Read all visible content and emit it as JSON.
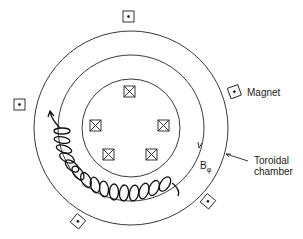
{
  "diagram": {
    "labels": {
      "magnet": "Magnet",
      "field": "B",
      "field_sub": "φ",
      "chamber_line1": "Toroidal",
      "chamber_line2": "chamber"
    },
    "center": [
      131,
      128
    ],
    "radii": {
      "outer": 97,
      "middle": 73,
      "inner": 49
    },
    "coil_count": 5,
    "magnet_count": 6
  }
}
